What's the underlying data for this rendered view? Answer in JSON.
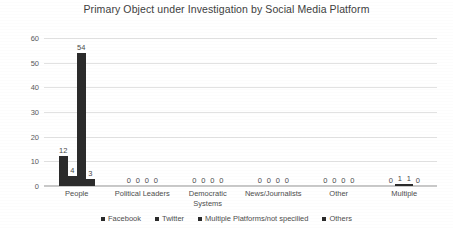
{
  "chart_data": {
    "type": "bar",
    "title": "Primary Object under Investigation by Social Media Platform",
    "xlabel": "",
    "ylabel": "",
    "ylim": [
      0,
      60
    ],
    "yticks": [
      0,
      10,
      20,
      30,
      40,
      50,
      60
    ],
    "grid": true,
    "legend_position": "bottom",
    "categories": [
      "People",
      "Political Leaders",
      "Democratic Systems",
      "News/Journalists",
      "Other",
      "Multiple"
    ],
    "series": [
      {
        "name": "Facebook",
        "values": [
          12,
          0,
          0,
          0,
          0,
          0
        ],
        "color": "#2b2b2b"
      },
      {
        "name": "Twitter",
        "values": [
          4,
          0,
          0,
          0,
          0,
          1
        ],
        "color": "#2b2b2b"
      },
      {
        "name": "Multiple Platforms/not specilied",
        "values": [
          54,
          0,
          0,
          0,
          0,
          1
        ],
        "color": "#2b2b2b"
      },
      {
        "name": "Others",
        "values": [
          3,
          0,
          0,
          0,
          0,
          0
        ],
        "color": "#2b2b2b"
      }
    ]
  },
  "legend": {
    "items": [
      {
        "label": "Facebook"
      },
      {
        "label": "Twitter"
      },
      {
        "label": "Multiple Platforms/not specilied"
      },
      {
        "label": "Others"
      }
    ]
  }
}
